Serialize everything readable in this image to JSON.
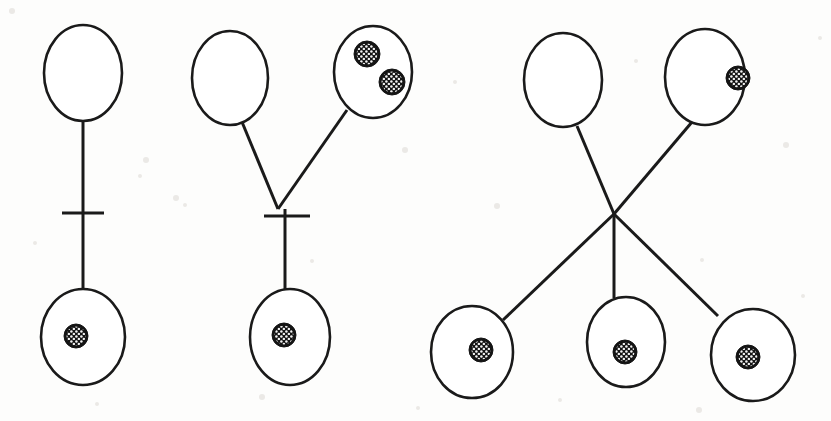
{
  "figure": {
    "background_color": "#fdfdfc",
    "stroke_color": "#1a1a1a",
    "nucleus_color": "#141414",
    "nucleus_pattern": "stippled-hatch",
    "width": 831,
    "height": 421,
    "panel_count": 3,
    "panels": [
      {
        "id": "panel-1",
        "name": "single-linear-pair",
        "label": "",
        "cells": [
          {
            "id": "p1-top",
            "name": "upper-cell",
            "cx": 83,
            "cy": 73,
            "rx": 39,
            "ry": 48,
            "nuclei": []
          },
          {
            "id": "p1-bottom",
            "name": "lower-cell",
            "cx": 83,
            "cy": 337,
            "rx": 42,
            "ry": 48,
            "nuclei": [
              {
                "cx": 76,
                "cy": 336,
                "r": 12
              }
            ]
          }
        ],
        "connectors": [
          {
            "x1": 83,
            "y1": 121,
            "x2": 83,
            "y2": 290
          }
        ],
        "ticks": [
          {
            "x1": 62,
            "y1": 213,
            "x2": 104,
            "y2": 213
          }
        ]
      },
      {
        "id": "panel-2",
        "name": "y-branch-pair",
        "label": "",
        "cells": [
          {
            "id": "p2-top-left",
            "name": "upper-left-cell",
            "cx": 230,
            "cy": 78,
            "rx": 38,
            "ry": 47,
            "nuclei": []
          },
          {
            "id": "p2-top-right",
            "name": "upper-right-cell",
            "cx": 373,
            "cy": 72,
            "rx": 39,
            "ry": 46,
            "nuclei": [
              {
                "cx": 367,
                "cy": 54,
                "r": 13
              },
              {
                "cx": 392,
                "cy": 82,
                "r": 13
              }
            ]
          },
          {
            "id": "p2-bottom",
            "name": "lower-cell",
            "cx": 290,
            "cy": 337,
            "rx": 40,
            "ry": 48,
            "nuclei": [
              {
                "cx": 284,
                "cy": 335,
                "r": 12
              }
            ]
          }
        ],
        "connectors": [
          {
            "x1": 242,
            "y1": 122,
            "x2": 278,
            "y2": 209
          },
          {
            "x1": 347,
            "y1": 110,
            "x2": 278,
            "y2": 209
          },
          {
            "x1": 285,
            "y1": 209,
            "x2": 285,
            "y2": 290
          }
        ],
        "ticks": [
          {
            "x1": 264,
            "y1": 216,
            "x2": 310,
            "y2": 216
          }
        ]
      },
      {
        "id": "panel-3",
        "name": "crossed-multi-branch",
        "label": "",
        "cells": [
          {
            "id": "p3-top-left",
            "name": "upper-left-cell",
            "cx": 563,
            "cy": 80,
            "rx": 39,
            "ry": 47,
            "nuclei": []
          },
          {
            "id": "p3-top-right",
            "name": "upper-right-cell",
            "cx": 705,
            "cy": 77,
            "rx": 40,
            "ry": 48,
            "nuclei": [
              {
                "cx": 738,
                "cy": 78,
                "r": 12
              }
            ]
          },
          {
            "id": "p3-bottom-left",
            "name": "lower-left-cell",
            "cx": 472,
            "cy": 352,
            "rx": 41,
            "ry": 46,
            "nuclei": [
              {
                "cx": 481,
                "cy": 350,
                "r": 12
              }
            ]
          },
          {
            "id": "p3-bottom-middle",
            "name": "lower-middle-cell",
            "cx": 626,
            "cy": 342,
            "rx": 39,
            "ry": 45,
            "nuclei": [
              {
                "cx": 625,
                "cy": 352,
                "r": 12
              }
            ]
          },
          {
            "id": "p3-bottom-right",
            "name": "lower-right-cell",
            "cx": 753,
            "cy": 355,
            "rx": 42,
            "ry": 46,
            "nuclei": [
              {
                "cx": 748,
                "cy": 357,
                "r": 12
              }
            ]
          }
        ],
        "connectors": [
          {
            "x1": 577,
            "y1": 126,
            "x2": 614,
            "y2": 214
          },
          {
            "x1": 692,
            "y1": 122,
            "x2": 614,
            "y2": 214
          },
          {
            "x1": 614,
            "y1": 214,
            "x2": 503,
            "y2": 320
          },
          {
            "x1": 614,
            "y1": 214,
            "x2": 614,
            "y2": 298
          },
          {
            "x1": 614,
            "y1": 214,
            "x2": 718,
            "y2": 316
          }
        ],
        "ticks": []
      }
    ],
    "specks": [
      {
        "cx": 12,
        "cy": 11,
        "r": 3
      },
      {
        "cx": 146,
        "cy": 160,
        "r": 3
      },
      {
        "cx": 140,
        "cy": 176,
        "r": 2
      },
      {
        "cx": 185,
        "cy": 205,
        "r": 2
      },
      {
        "cx": 176,
        "cy": 198,
        "r": 3
      },
      {
        "cx": 312,
        "cy": 261,
        "r": 2
      },
      {
        "cx": 405,
        "cy": 150,
        "r": 3
      },
      {
        "cx": 455,
        "cy": 82,
        "r": 2
      },
      {
        "cx": 497,
        "cy": 206,
        "r": 3
      },
      {
        "cx": 636,
        "cy": 61,
        "r": 2
      },
      {
        "cx": 702,
        "cy": 260,
        "r": 2
      },
      {
        "cx": 786,
        "cy": 145,
        "r": 3
      },
      {
        "cx": 803,
        "cy": 296,
        "r": 2
      },
      {
        "cx": 97,
        "cy": 404,
        "r": 2
      },
      {
        "cx": 262,
        "cy": 397,
        "r": 3
      },
      {
        "cx": 418,
        "cy": 408,
        "r": 2
      },
      {
        "cx": 560,
        "cy": 400,
        "r": 2
      },
      {
        "cx": 699,
        "cy": 410,
        "r": 3
      },
      {
        "cx": 35,
        "cy": 243,
        "r": 2
      },
      {
        "cx": 820,
        "cy": 38,
        "r": 2
      }
    ]
  }
}
